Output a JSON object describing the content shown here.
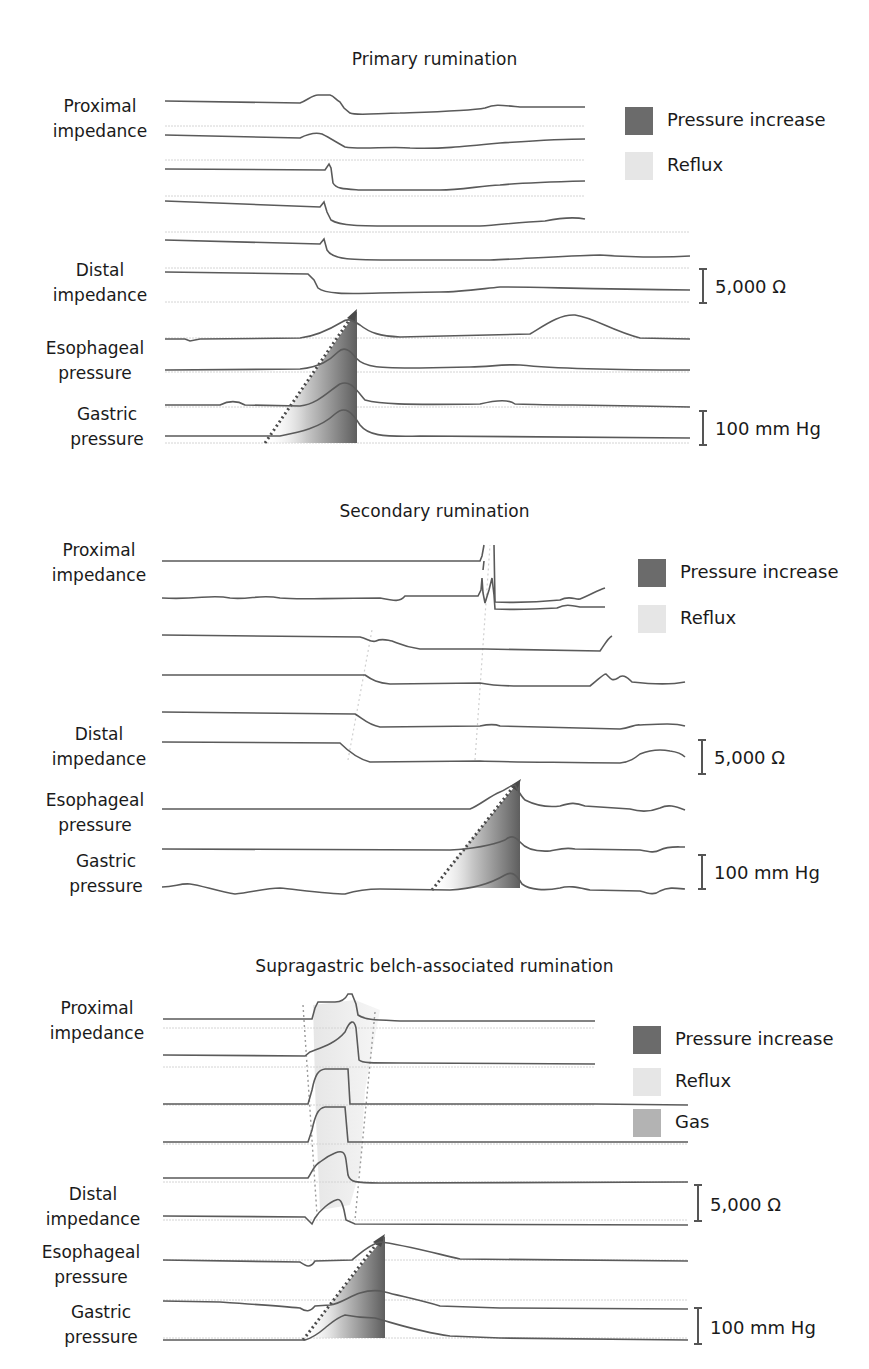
{
  "figure": {
    "panels": [
      {
        "id": "primary",
        "title": "Primary rumination",
        "row_labels": {
          "proximal_impedance": [
            "Proximal",
            "impedance"
          ],
          "distal_impedance": [
            "Distal",
            "impedance"
          ],
          "esophageal_pressure": [
            "Esophageal",
            "pressure"
          ],
          "gastric_pressure": [
            "Gastric",
            "pressure"
          ]
        },
        "legend": [
          {
            "label": "Pressure increase",
            "color": "#6b6b6b"
          },
          {
            "label": "Reflux",
            "color": "#e6e6e6"
          }
        ],
        "scales": [
          {
            "label": "5,000 Ω"
          },
          {
            "label": "100 mm Hg"
          }
        ]
      },
      {
        "id": "secondary",
        "title": "Secondary rumination",
        "row_labels": {
          "proximal_impedance": [
            "Proximal",
            "impedance"
          ],
          "distal_impedance": [
            "Distal",
            "impedance"
          ],
          "esophageal_pressure": [
            "Esophageal",
            "pressure"
          ],
          "gastric_pressure": [
            "Gastric",
            "pressure"
          ]
        },
        "legend": [
          {
            "label": "Pressure increase",
            "color": "#6b6b6b"
          },
          {
            "label": "Reflux",
            "color": "#e6e6e6"
          }
        ],
        "scales": [
          {
            "label": "5,000 Ω"
          },
          {
            "label": "100 mm Hg"
          }
        ]
      },
      {
        "id": "supragastric",
        "title": "Supragastric belch-associated rumination",
        "row_labels": {
          "proximal_impedance": [
            "Proximal",
            "impedance"
          ],
          "distal_impedance": [
            "Distal",
            "impedance"
          ],
          "esophageal_pressure": [
            "Esophageal",
            "pressure"
          ],
          "gastric_pressure": [
            "Gastric",
            "pressure"
          ]
        },
        "legend": [
          {
            "label": "Pressure increase",
            "color": "#6b6b6b"
          },
          {
            "label": "Reflux",
            "color": "#e6e6e6"
          },
          {
            "label": "Gas",
            "color": "#b3b3b3"
          }
        ],
        "scales": [
          {
            "label": "5,000 Ω"
          },
          {
            "label": "100 mm Hg"
          }
        ]
      }
    ],
    "colors": {
      "trace": "#5a5a5a",
      "baseline": "#cfcfcf",
      "pressure_increase": "#6b6b6b",
      "reflux": "#e6e6e6",
      "gas": "#b3b3b3",
      "dotted_arrow": "#555555"
    }
  }
}
